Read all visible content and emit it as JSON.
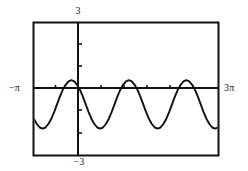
{
  "figure": {
    "kind": "graphing-calculator-plot",
    "labels": {
      "top": "3",
      "bottom": "−3",
      "left": "−π",
      "right": "3π"
    },
    "colors": {
      "curve": "#111111",
      "axis": "#111111",
      "frame": "#111111",
      "background": "#ffffff"
    }
  },
  "chart_data": {
    "type": "line",
    "title": "",
    "xlabel": "",
    "ylabel": "",
    "xlim": [
      -3.141592653589793,
      9.42477796076938
    ],
    "ylim": [
      -3,
      3
    ],
    "xtick_labels": [
      "−π",
      "3π"
    ],
    "ytick_labels": [
      "3",
      "−3"
    ],
    "xticks": [
      -1.5707963267948966,
      0,
      1.5707963267948966,
      3.141592653589793,
      4.71238898038469,
      6.283185307179586,
      7.853981633974483
    ],
    "yticks": [
      -2,
      -1,
      1,
      2
    ],
    "grid": false,
    "legend": null,
    "series": [
      {
        "name": "curve",
        "x": [
          -3.1416,
          -2.9452,
          -2.7489,
          -2.5525,
          -2.3562,
          -2.1598,
          -1.9635,
          -1.7671,
          -1.5708,
          -1.3744,
          -1.1781,
          -0.9817,
          -0.7854,
          -0.589,
          -0.3927,
          -0.1963,
          0.0,
          0.1963,
          0.3927,
          0.589,
          0.7854,
          0.9817,
          1.1781,
          1.3744,
          1.5708,
          1.7671,
          1.9635,
          2.1598,
          2.3562,
          2.5525,
          2.7489,
          2.9452,
          3.1416,
          3.3379,
          3.5343,
          3.7306,
          3.927,
          4.1233,
          4.3197,
          4.516,
          4.7124,
          4.9087,
          5.1051,
          5.3014,
          5.4978,
          5.6941,
          5.8905,
          6.0868,
          6.2832,
          6.4795,
          6.6759,
          6.8722,
          7.0686,
          7.2649,
          7.4613,
          7.6576,
          7.854,
          8.0503,
          8.2467,
          8.443,
          8.6394,
          8.8357,
          9.0321,
          9.2284,
          9.4248
        ],
        "y": [
          -1.36,
          -1.59,
          -1.75,
          -1.8,
          -1.75,
          -1.59,
          -1.36,
          -1.05,
          -0.7,
          -0.35,
          -0.04,
          0.19,
          0.35,
          0.4,
          0.35,
          0.19,
          -0.04,
          -0.35,
          -0.7,
          -1.05,
          -1.36,
          -1.59,
          -1.75,
          -1.8,
          -1.75,
          -1.59,
          -1.36,
          -1.05,
          -0.7,
          -0.35,
          -0.04,
          0.19,
          0.35,
          0.4,
          0.35,
          0.19,
          -0.04,
          -0.35,
          -0.7,
          -1.05,
          -1.36,
          -1.59,
          -1.75,
          -1.8,
          -1.75,
          -1.59,
          -1.36,
          -1.05,
          -0.7,
          -0.35,
          -0.04,
          0.19,
          0.35,
          0.4,
          0.35,
          0.19,
          -0.04,
          -0.35,
          -0.7,
          -1.05,
          -1.36,
          -1.59,
          -1.75,
          -1.8,
          -1.75
        ]
      }
    ]
  }
}
